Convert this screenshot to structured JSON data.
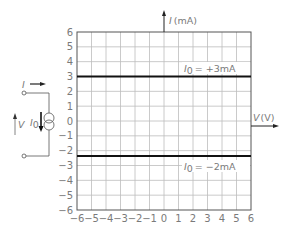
{
  "chart_data": {
    "type": "line",
    "title": "",
    "xlabel": "V (V)",
    "ylabel": "I (mA)",
    "xlim": [
      -6,
      6
    ],
    "ylim": [
      -6,
      6
    ],
    "grid": true,
    "x_ticks": [
      "-6",
      "-5",
      "-4",
      "-3",
      "-2",
      "-1",
      "0",
      "1",
      "2",
      "3",
      "4",
      "5",
      "6"
    ],
    "y_ticks": [
      "6",
      "5",
      "4",
      "3",
      "2",
      "1",
      "0",
      "-1",
      "-2",
      "-3",
      "-4",
      "-5",
      "-6"
    ],
    "series": [
      {
        "name": "I0 = +3mA",
        "x": [
          -6,
          6
        ],
        "y": [
          3,
          3
        ]
      },
      {
        "name": "I0 = -2mA",
        "x": [
          -6,
          6
        ],
        "y": [
          -2,
          -2
        ]
      }
    ],
    "annotations": [
      {
        "text": "I0 = +3mA",
        "x": 2.5,
        "y": 3.5
      },
      {
        "text": "I0 = -2mA",
        "x": 2.5,
        "y": -2.6
      }
    ]
  },
  "labels": {
    "y_axis_italic": "I",
    "y_axis_unit": "(mA)",
    "x_axis_italic": "V",
    "x_axis_unit": "(V)",
    "line1_sym": "I",
    "line1_sub": "0",
    "line1_val": "= +3mA",
    "line2_sym": "I",
    "line2_sub": "0",
    "line2_val": "= −2mA"
  },
  "circuit": {
    "current_label": "I",
    "voltage_label": "V",
    "source_label": "I",
    "source_sub": "0"
  },
  "x_tick_labels": [
    "−6",
    "−5",
    "−4",
    "−3",
    "−2",
    "−1",
    "0",
    "1",
    "2",
    "3",
    "4",
    "5",
    "6"
  ],
  "y_tick_labels": [
    "6",
    "5",
    "4",
    "3",
    "2",
    "1",
    "0",
    "−1",
    "−2",
    "−3",
    "−4",
    "−5",
    "−6"
  ]
}
